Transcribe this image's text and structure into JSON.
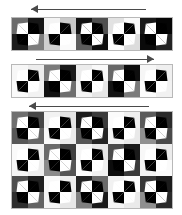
{
  "figure": {
    "background_color": "#ffffff",
    "border_color": "#b8b8b8",
    "arrow_color": "#4a4a4a",
    "blade_light_color": "#ffffff",
    "blade_dark_color": "#000000",
    "cell_size": 32,
    "panels": [
      {
        "name": "panel-top",
        "arrow": {
          "direction": "left",
          "label": "leftward-arrow",
          "x": 31,
          "width": 115
        },
        "columns": 5,
        "rows": 1,
        "left": 11,
        "top": 17,
        "grid": [
          [
            {
              "tl": "#6b6b6b",
              "tr": "#161616",
              "bl": "#1c1c1c",
              "br": "#7d7d7d"
            },
            {
              "tl": "#f4f4f4",
              "tr": "#c9c9c9",
              "bl": "#cfcfcf",
              "br": "#fbfbfb"
            },
            {
              "tl": "#121212",
              "tr": "#4f4f4f",
              "bl": "#5c5c5c",
              "br": "#0d0d0d"
            },
            {
              "tl": "#e2e2e2",
              "tr": "#fafafa",
              "bl": "#fdfdfd",
              "br": "#dcdcdc"
            },
            {
              "tl": "#191919",
              "tr": "#050505",
              "bl": "#0a0a0a",
              "br": "#232323"
            }
          ]
        ]
      },
      {
        "name": "panel-middle",
        "arrow": {
          "direction": "right",
          "label": "rightward-arrow",
          "x": 36,
          "width": 118
        },
        "columns": 5,
        "rows": 1,
        "left": 11,
        "top": 64,
        "grid": [
          [
            {
              "tl": "#f7f7f7",
              "tr": "#ededed",
              "bl": "#fafafa",
              "br": "#f2f2f2"
            },
            {
              "tl": "#7a7a7a",
              "tr": "#1a1a1a",
              "bl": "#121212",
              "br": "#6e6e6e"
            },
            {
              "tl": "#ececec",
              "tr": "#f9f9f9",
              "bl": "#f4f4f4",
              "br": "#e6e6e6"
            },
            {
              "tl": "#686868",
              "tr": "#0e0e0e",
              "bl": "#141414",
              "br": "#7b7b7b"
            },
            {
              "tl": "#f6f6f6",
              "tr": "#efefef",
              "bl": "#fcfcfc",
              "br": "#f1f1f1"
            }
          ]
        ]
      },
      {
        "name": "panel-bottom",
        "arrow": {
          "direction": "left",
          "label": "leftward-arrow",
          "x": 29,
          "width": 120
        },
        "columns": 5,
        "rows": 3,
        "left": 11,
        "top": 111,
        "grid": [
          [
            {
              "tl": "#6f6f6f",
              "tr": "#474747",
              "bl": "#575757",
              "br": "#666666"
            },
            {
              "tl": "#f2f2f2",
              "tr": "#e4e4e4",
              "bl": "#fafafa",
              "br": "#ebebeb"
            },
            {
              "tl": "#1d1d1d",
              "tr": "#3a3a3a",
              "bl": "#565656",
              "br": "#242424"
            },
            {
              "tl": "#fbfbfb",
              "tr": "#efefef",
              "bl": "#f4f4f4",
              "br": "#e9e9e9"
            },
            {
              "tl": "#5b5b5b",
              "tr": "#2b2b2b",
              "bl": "#909090",
              "br": "#4a4a4a"
            }
          ],
          [
            {
              "tl": "#fafafa",
              "tr": "#f0f0f0",
              "bl": "#f5f5f5",
              "br": "#ededed"
            },
            {
              "tl": "#6a6a6a",
              "tr": "#3e3e3e",
              "bl": "#8b8b8b",
              "br": "#555555"
            },
            {
              "tl": "#f6f6f6",
              "tr": "#e8e8e8",
              "bl": "#fcfcfc",
              "br": "#f0f0f0"
            },
            {
              "tl": "#4c4c4c",
              "tr": "#1b1b1b",
              "bl": "#0c0c0c",
              "br": "#3a3a3a"
            },
            {
              "tl": "#f8f8f8",
              "tr": "#ebebeb",
              "bl": "#f3f3f3",
              "br": "#fafafa"
            }
          ],
          [
            {
              "tl": "#4f4f4f",
              "tr": "#202020",
              "bl": "#2e2e2e",
              "br": "#636363"
            },
            {
              "tl": "#f9f9f9",
              "tr": "#eeeeee",
              "bl": "#f6f6f6",
              "br": "#e7e7e7"
            },
            {
              "tl": "#232323",
              "tr": "#6a6a6a",
              "bl": "#7f7f7f",
              "br": "#1a1a1a"
            },
            {
              "tl": "#f1f1f1",
              "tr": "#fbfbfb",
              "bl": "#f5f5f5",
              "br": "#eaeaea"
            },
            {
              "tl": "#383838",
              "tr": "#1c1c1c",
              "bl": "#8f8f8f",
              "br": "#2a2a2a"
            }
          ]
        ]
      }
    ]
  }
}
